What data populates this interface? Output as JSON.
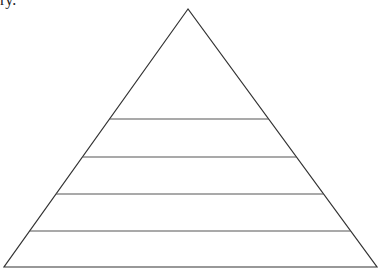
{
  "text_fragment": "ry.",
  "diagram": {
    "type": "pyramid",
    "levels": 5,
    "apex": [
      188,
      9
    ],
    "base_left": [
      4,
      267
    ],
    "base_right": [
      377,
      267
    ],
    "divider_y": [
      119,
      157,
      194,
      231
    ],
    "stroke_color": "#333333",
    "divider_color": "#555555",
    "labels": []
  }
}
